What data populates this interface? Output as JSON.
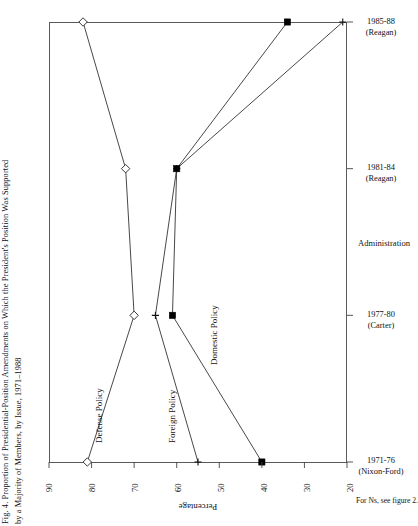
{
  "figure": {
    "caption_lines": [
      "Fig. 4. Proportion of Presidential-Position Amendments on Which the President's Position Was Supported",
      "by a Majority of Members, by Issue, 1971–1988"
    ],
    "footnote": "For Ns, see figure 2."
  },
  "axes": {
    "percentage_title": "Percentage",
    "administration_title": "Administration",
    "percentage_ticks": [
      "90",
      "80",
      "70",
      "60",
      "50",
      "40",
      "30",
      "20"
    ],
    "administration_ticks": [
      {
        "period": "1971-76",
        "president": "(Nixon-Ford)"
      },
      {
        "period": "1977-80",
        "president": "(Carter)"
      },
      {
        "period": "1981-84",
        "president": "(Reagan)"
      },
      {
        "period": "1985-88",
        "president": "(Reagan)"
      }
    ]
  },
  "series_labels": {
    "defense": "Defense Policy",
    "foreign": "Foreign Policy",
    "domestic": "Domestic Policy"
  },
  "chart_data": {
    "type": "line",
    "title": "Fig. 4. Proportion of Presidential-Position Amendments on Which the President's Position Was Supported by a Majority of Members, by Issue, 1971–1988",
    "orientation": "horizontal-value-axis",
    "xlabel": "Percentage",
    "ylabel": "Administration",
    "xlim": [
      90,
      20
    ],
    "x_ticks": [
      90,
      80,
      70,
      60,
      50,
      40,
      30,
      20
    ],
    "categories": [
      "1971-76 (Nixon-Ford)",
      "1977-80 (Carter)",
      "1981-84 (Reagan)",
      "1985-88 (Reagan)"
    ],
    "grid": false,
    "legend": "inline-labels",
    "series": [
      {
        "name": "Defense Policy",
        "marker": "open-diamond",
        "values": [
          81,
          70,
          72,
          82
        ]
      },
      {
        "name": "Foreign Policy",
        "marker": "plus",
        "values": [
          55,
          65,
          60,
          21
        ]
      },
      {
        "name": "Domestic Policy",
        "marker": "filled-square",
        "values": [
          40,
          61,
          60,
          34
        ]
      }
    ]
  },
  "colors": {
    "line": "#333333",
    "frame": "#5a5a5a",
    "text": "#111111"
  }
}
